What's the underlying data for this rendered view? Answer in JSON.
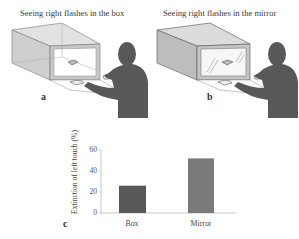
{
  "figure": {
    "panels": [
      {
        "id": "a",
        "label": "a",
        "title": "Seeing right flashes in the box"
      },
      {
        "id": "b",
        "label": "b",
        "title": "Seeing right flashes in the mirror"
      },
      {
        "id": "c",
        "label": "c"
      }
    ]
  },
  "colors": {
    "box_side": "#c8c8c8",
    "box_top": "#dcdcdc",
    "box_edge": "#666666",
    "person": "#585858",
    "bar_box": "#585858",
    "bar_mirror": "#7a7a7a",
    "axis": "#bbbbbb"
  },
  "chart_data": {
    "type": "bar",
    "title": "",
    "xlabel": "",
    "ylabel": "Extinction of left touch (%)",
    "categories": [
      "Box",
      "Mirror"
    ],
    "values": [
      26,
      52
    ],
    "ylim": [
      0,
      60
    ],
    "yticks": [
      0,
      20,
      40,
      60
    ],
    "ytick_labels": [
      "0",
      "20",
      "40",
      "60"
    ],
    "grid": false,
    "legend": null,
    "bar_colors": [
      "#585858",
      "#7a7a7a"
    ]
  }
}
